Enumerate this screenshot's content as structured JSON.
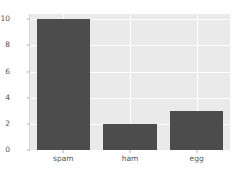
{
  "chart_data": {
    "type": "bar",
    "title": "",
    "xlabel": "",
    "ylabel": "",
    "categories": [
      "spam",
      "ham",
      "egg"
    ],
    "values": [
      10,
      2,
      3
    ],
    "series": [
      {
        "name": "counts",
        "values": [
          10,
          2,
          3
        ]
      }
    ],
    "ylim": [
      0,
      10.4
    ],
    "yticks": [
      0,
      2,
      4,
      6,
      8,
      10
    ],
    "ytick_labels": [
      "0",
      "2",
      "4",
      "6",
      "8",
      "10"
    ],
    "xtick_labels": [
      "spam",
      "ham",
      "egg"
    ],
    "grid": true,
    "grid_axis": "both",
    "legend": null,
    "bar_color": "#4c4c4c",
    "axes_facecolor": "#eaeaea",
    "figure_facecolor": "#ffffff",
    "gridline_color": "#ffffff",
    "tick_label_color": "#555555",
    "bar_width_fraction": 0.8
  }
}
